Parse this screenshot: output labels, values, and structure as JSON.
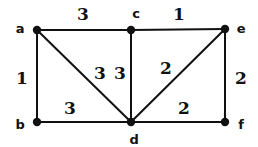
{
  "figure": {
    "type": "weighted-undirected-graph",
    "background_color": "#ffffff",
    "stroke_color": "#111111",
    "text_color": "#111111"
  },
  "nodes": [
    {
      "id": "a",
      "label": "a",
      "x": 37,
      "y": 30,
      "label_x": 20,
      "label_y": 28
    },
    {
      "id": "c",
      "label": "c",
      "x": 131,
      "y": 30,
      "label_x": 136,
      "label_y": 13
    },
    {
      "id": "e",
      "label": "e",
      "x": 225,
      "y": 29,
      "label_x": 241,
      "label_y": 28
    },
    {
      "id": "b",
      "label": "b",
      "x": 37,
      "y": 122,
      "label_x": 20,
      "label_y": 124
    },
    {
      "id": "d",
      "label": "d",
      "x": 131,
      "y": 122,
      "label_x": 134,
      "label_y": 139
    },
    {
      "id": "f",
      "label": "f",
      "x": 225,
      "y": 122,
      "label_x": 241,
      "label_y": 124
    }
  ],
  "edges": [
    {
      "id": "a-c",
      "from": "a",
      "to": "c",
      "weight": "3",
      "weight_x": 83,
      "weight_y": 14
    },
    {
      "id": "c-e",
      "from": "c",
      "to": "e",
      "weight": "1",
      "weight_x": 179,
      "weight_y": 14
    },
    {
      "id": "a-b",
      "from": "a",
      "to": "b",
      "weight": "1",
      "weight_x": 22,
      "weight_y": 78
    },
    {
      "id": "a-d",
      "from": "a",
      "to": "d",
      "weight": "3",
      "weight_x": 100,
      "weight_y": 73
    },
    {
      "id": "c-d",
      "from": "c",
      "to": "d",
      "weight": "3",
      "weight_x": 120,
      "weight_y": 73
    },
    {
      "id": "d-e",
      "from": "d",
      "to": "e",
      "weight": "2",
      "weight_x": 166,
      "weight_y": 68
    },
    {
      "id": "e-f",
      "from": "e",
      "to": "f",
      "weight": "2",
      "weight_x": 241,
      "weight_y": 78
    },
    {
      "id": "b-d",
      "from": "b",
      "to": "d",
      "weight": "3",
      "weight_x": 70,
      "weight_y": 108
    },
    {
      "id": "d-f",
      "from": "d",
      "to": "f",
      "weight": "2",
      "weight_x": 184,
      "weight_y": 108
    }
  ],
  "style": {
    "edge_width": 2,
    "node_radius": 4.2
  }
}
